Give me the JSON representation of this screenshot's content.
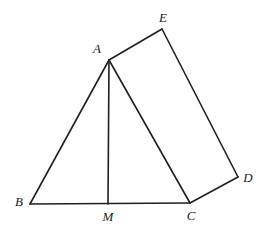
{
  "figure": {
    "type": "geometric-diagram",
    "canvas": {
      "width": 266,
      "height": 230
    },
    "background_color": "#ffffff",
    "stroke_color": "#1f1f25",
    "stroke_width": 1.6
  },
  "points": {
    "A": {
      "label": "A",
      "x": 109,
      "y": 60,
      "label_x": 97,
      "label_y": 48
    },
    "B": {
      "label": "B",
      "x": 30,
      "y": 204,
      "label_x": 19,
      "label_y": 201
    },
    "C": {
      "label": "C",
      "x": 190,
      "y": 203,
      "label_x": 191,
      "label_y": 215
    },
    "D": {
      "label": "D",
      "x": 238,
      "y": 177,
      "label_x": 248,
      "label_y": 177
    },
    "E": {
      "label": "E",
      "x": 162,
      "y": 29,
      "label_x": 163,
      "label_y": 17
    },
    "M": {
      "label": "M",
      "x": 108,
      "y": 204,
      "label_x": 108,
      "label_y": 216
    }
  },
  "segments": [
    {
      "name": "segment-AB",
      "from": "A",
      "to": "B"
    },
    {
      "name": "segment-BC",
      "from": "B",
      "to": "C"
    },
    {
      "name": "segment-AC",
      "from": "A",
      "to": "C"
    },
    {
      "name": "segment-AM",
      "from": "A",
      "to": "M"
    },
    {
      "name": "segment-AE",
      "from": "A",
      "to": "E"
    },
    {
      "name": "segment-ED",
      "from": "E",
      "to": "D"
    },
    {
      "name": "segment-DC",
      "from": "D",
      "to": "C"
    }
  ],
  "labels": [
    "A",
    "B",
    "C",
    "D",
    "E",
    "M"
  ]
}
